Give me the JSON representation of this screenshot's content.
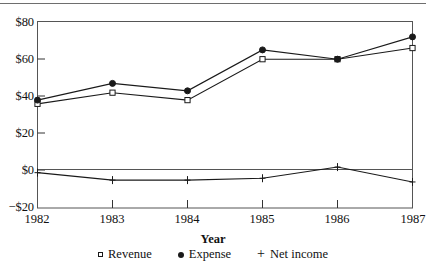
{
  "chart_data": {
    "type": "line",
    "title": "",
    "xlabel": "Year",
    "ylabel": "",
    "categories": [
      "1982",
      "1983",
      "1984",
      "1985",
      "1986",
      "1987"
    ],
    "x": [
      1982,
      1983,
      1984,
      1985,
      1986,
      1987
    ],
    "series": [
      {
        "name": "Revenue",
        "marker": "open-square",
        "values": [
          36,
          42,
          38,
          60,
          60,
          66
        ]
      },
      {
        "name": "Expense",
        "marker": "filled-circle",
        "values": [
          38,
          47,
          43,
          65,
          60,
          72
        ]
      },
      {
        "name": "Net income",
        "marker": "plus",
        "values": [
          -1,
          -5,
          -5,
          -4,
          2,
          -6
        ]
      }
    ],
    "ylim": [
      -20,
      80
    ],
    "xlim": [
      1982,
      1987
    ],
    "ytick_values": [
      80,
      60,
      40,
      20,
      0,
      -20
    ],
    "ytick_labels": [
      "$80",
      "$60",
      "$40",
      "$20",
      "$0",
      "−$20"
    ],
    "xtick_labels": [
      "1982",
      "1983",
      "1984",
      "1985",
      "1986",
      "1987"
    ],
    "grid": false,
    "legend_position": "bottom-center",
    "zero_line": true,
    "line_color": "#1a1a1a",
    "axis_color": "#555555",
    "background": "#ffffff"
  },
  "legend": {
    "items": [
      {
        "label": "Revenue",
        "marker_name": "open-square-marker-icon"
      },
      {
        "label": "Expense",
        "marker_name": "filled-circle-marker-icon"
      },
      {
        "label": "Net income",
        "marker_name": "plus-marker-icon",
        "glyph": "+"
      }
    ]
  },
  "axes": {
    "x_title": "Year",
    "y_labels": [
      "$80",
      "$60",
      "$40",
      "$20",
      "$0",
      "−$20"
    ],
    "x_labels": [
      "1982",
      "1983",
      "1984",
      "1985",
      "1986",
      "1987"
    ]
  }
}
